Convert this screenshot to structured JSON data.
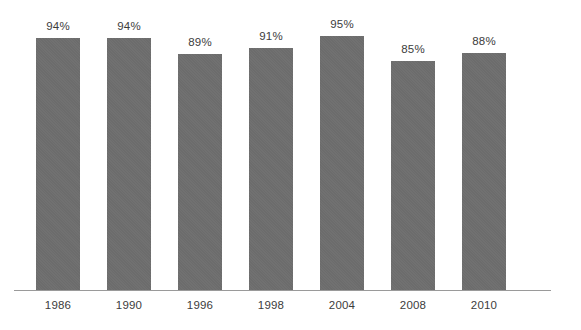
{
  "chart_data": {
    "type": "bar",
    "title": "",
    "subtitle": "",
    "xlabel": "",
    "ylabel": "",
    "categories": [
      "1986",
      "1990",
      "1996",
      "1998",
      "2004",
      "2008",
      "2010"
    ],
    "values": [
      94,
      94,
      89,
      91,
      95,
      85,
      88
    ],
    "value_labels": [
      "94%",
      "94%",
      "89%",
      "91%",
      "95%",
      "85%",
      "88%"
    ],
    "ylim": [
      0,
      100
    ],
    "grid": false,
    "legend": null,
    "legend_position": "none",
    "axis_visible": {
      "x": true,
      "y": false
    },
    "annotations": [],
    "colors": {
      "bar": "#6e6e6e",
      "axis": "#9a9a9a",
      "text": "#3c3c3c",
      "background": "#ffffff"
    }
  }
}
